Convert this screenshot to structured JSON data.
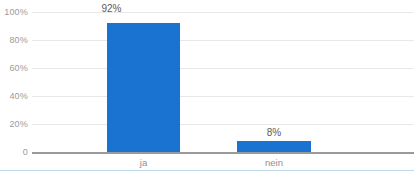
{
  "chart_data": {
    "type": "bar",
    "title": "",
    "xlabel": "",
    "ylabel": "",
    "categories": [
      "ja",
      "nein"
    ],
    "values": [
      92,
      8
    ],
    "data_labels": [
      "92%",
      "8%"
    ],
    "ylim": [
      0,
      100
    ],
    "yticks": [
      0,
      20,
      40,
      60,
      80,
      100
    ],
    "ytick_labels": [
      "0",
      "20%",
      "40%",
      "60%",
      "80%",
      "100%"
    ],
    "grid": true,
    "legend": "none",
    "series": [
      {
        "name": "Anteil",
        "values": [
          92,
          8
        ],
        "color": "#1a73d0"
      }
    ],
    "colors": {
      "bar": "#1a73d0",
      "gridline": "#e8e8e8",
      "baseline": "#9a9a9a",
      "axis_text": "#9b9b9b",
      "label_text": "#5a5a5a",
      "category_text": "#8f8f8f",
      "bottom_rule": "#bcd8ea",
      "background": "#ffffff"
    }
  }
}
